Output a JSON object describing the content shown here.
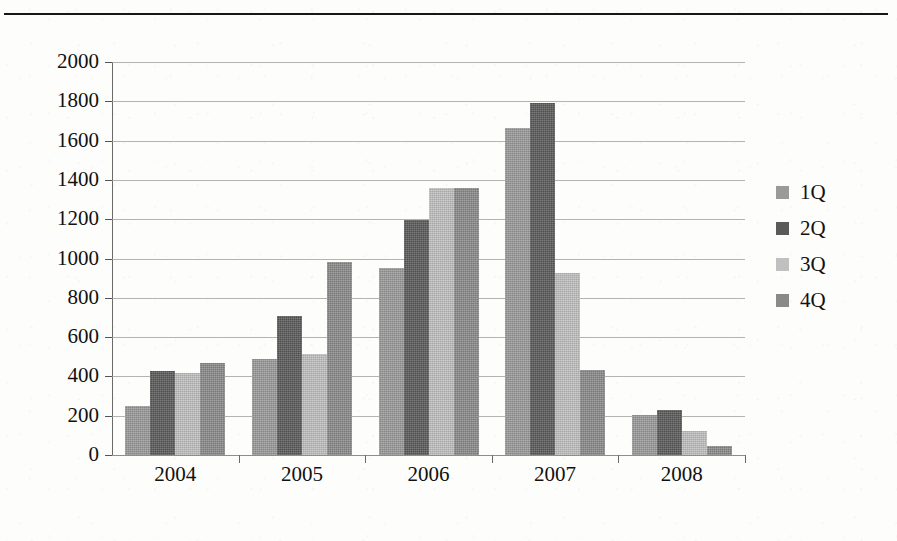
{
  "figure": {
    "top_rule": true,
    "background_color": "#fdfdfb"
  },
  "legend": {
    "position": "right",
    "entries": [
      {
        "label": "1Q",
        "color": "#9a9a9a",
        "swatch_name": "legend-swatch-1q"
      },
      {
        "label": "2Q",
        "color": "#5a5a5a",
        "swatch_name": "legend-swatch-2q"
      },
      {
        "label": "3Q",
        "color": "#c0c0c0",
        "swatch_name": "legend-swatch-3q"
      },
      {
        "label": "4Q",
        "color": "#8a8a8a",
        "swatch_name": "legend-swatch-4q"
      }
    ]
  },
  "axis": {
    "y_ticks": [
      "2000",
      "1800",
      "1600",
      "1400",
      "1200",
      "1000",
      "800",
      "600",
      "400",
      "200",
      "0"
    ],
    "x_ticks": [
      "2004",
      "2005",
      "2006",
      "2007",
      "2008"
    ]
  },
  "chart_data": {
    "type": "bar",
    "title": "",
    "subtitle": "",
    "xlabel": "",
    "ylabel": "",
    "categories": [
      "2004",
      "2005",
      "2006",
      "2007",
      "2008"
    ],
    "series": [
      {
        "name": "1Q",
        "color": "#9a9a9a",
        "values": [
          250,
          490,
          950,
          1665,
          205
        ]
      },
      {
        "name": "2Q",
        "color": "#5a5a5a",
        "values": [
          430,
          705,
          1195,
          1790,
          230
        ]
      },
      {
        "name": "3Q",
        "color": "#c0c0c0",
        "values": [
          415,
          515,
          1360,
          925,
          120
        ]
      },
      {
        "name": "4Q",
        "color": "#8a8a8a",
        "values": [
          470,
          980,
          1360,
          435,
          45
        ]
      }
    ],
    "ylim": [
      0,
      2000
    ],
    "ytick_step": 200,
    "grid": true,
    "grid_axis": "y",
    "legend_position": "right",
    "bar_grouping": "grouped",
    "annotations": []
  }
}
